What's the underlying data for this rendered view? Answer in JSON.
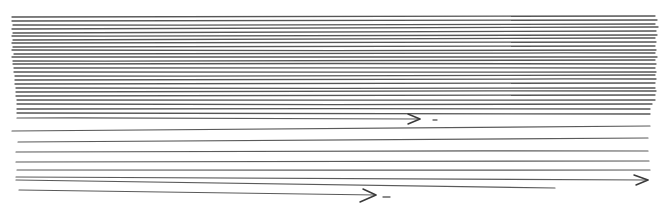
{
  "drawing": {
    "background": "#ffffff",
    "ink_color": "#4a4a4a",
    "dense_lines": [
      {
        "x1": 12,
        "y1": 17,
        "x2": 655,
        "y2": 16
      },
      {
        "x1": 12,
        "y1": 21,
        "x2": 657,
        "y2": 20
      },
      {
        "x1": 13,
        "y1": 25,
        "x2": 655,
        "y2": 24
      },
      {
        "x1": 12,
        "y1": 29,
        "x2": 658,
        "y2": 27
      },
      {
        "x1": 13,
        "y1": 33,
        "x2": 656,
        "y2": 31
      },
      {
        "x1": 12,
        "y1": 36,
        "x2": 657,
        "y2": 35
      },
      {
        "x1": 13,
        "y1": 40,
        "x2": 655,
        "y2": 38
      },
      {
        "x1": 12,
        "y1": 43,
        "x2": 656,
        "y2": 42
      },
      {
        "x1": 13,
        "y1": 47,
        "x2": 655,
        "y2": 46
      },
      {
        "x1": 12,
        "y1": 50,
        "x2": 656,
        "y2": 50
      },
      {
        "x1": 14,
        "y1": 54,
        "x2": 655,
        "y2": 53
      },
      {
        "x1": 12,
        "y1": 57,
        "x2": 657,
        "y2": 57
      },
      {
        "x1": 13,
        "y1": 61,
        "x2": 655,
        "y2": 60
      },
      {
        "x1": 13,
        "y1": 64,
        "x2": 656,
        "y2": 64
      },
      {
        "x1": 14,
        "y1": 68,
        "x2": 655,
        "y2": 68
      },
      {
        "x1": 14,
        "y1": 72,
        "x2": 656,
        "y2": 72
      },
      {
        "x1": 15,
        "y1": 76,
        "x2": 655,
        "y2": 75
      },
      {
        "x1": 15,
        "y1": 80,
        "x2": 656,
        "y2": 79
      },
      {
        "x1": 15,
        "y1": 84,
        "x2": 655,
        "y2": 83
      },
      {
        "x1": 16,
        "y1": 88,
        "x2": 655,
        "y2": 88
      },
      {
        "x1": 16,
        "y1": 92,
        "x2": 656,
        "y2": 91
      },
      {
        "x1": 16,
        "y1": 96,
        "x2": 655,
        "y2": 95
      },
      {
        "x1": 17,
        "y1": 100,
        "x2": 655,
        "y2": 100
      },
      {
        "x1": 17,
        "y1": 104,
        "x2": 652,
        "y2": 104
      },
      {
        "x1": 17,
        "y1": 109,
        "x2": 650,
        "y2": 109
      },
      {
        "x1": 17,
        "y1": 113,
        "x2": 650,
        "y2": 114
      }
    ],
    "sparse_lines": [
      {
        "x1": 12,
        "y1": 131,
        "x2": 650,
        "y2": 126
      },
      {
        "x1": 18,
        "y1": 142,
        "x2": 648,
        "y2": 138
      },
      {
        "x1": 16,
        "y1": 152,
        "x2": 648,
        "y2": 151
      },
      {
        "x1": 16,
        "y1": 162,
        "x2": 649,
        "y2": 161
      },
      {
        "x1": 17,
        "y1": 170,
        "x2": 650,
        "y2": 170
      },
      {
        "x1": 16,
        "y1": 180,
        "x2": 555,
        "y2": 188
      }
    ],
    "arrows": [
      {
        "name": "arrow-upper",
        "x1": 17,
        "y1": 118,
        "x2": 420,
        "y2": 119,
        "head": [
          [
            408,
            114
          ],
          [
            420,
            119
          ],
          [
            408,
            124
          ]
        ],
        "dash": {
          "x1": 433,
          "y1": 120,
          "x2": 437,
          "y2": 120
        }
      },
      {
        "name": "arrow-long",
        "x1": 16,
        "y1": 177,
        "x2": 648,
        "y2": 180,
        "head": [
          [
            634,
            175
          ],
          [
            648,
            180
          ],
          [
            636,
            185
          ]
        ],
        "dash": null
      },
      {
        "name": "arrow-lower",
        "x1": 19,
        "y1": 190,
        "x2": 376,
        "y2": 195,
        "head": [
          [
            363,
            189
          ],
          [
            376,
            195
          ],
          [
            360,
            202
          ]
        ],
        "dash": {
          "x1": 383,
          "y1": 197,
          "x2": 390,
          "y2": 197
        }
      }
    ]
  }
}
